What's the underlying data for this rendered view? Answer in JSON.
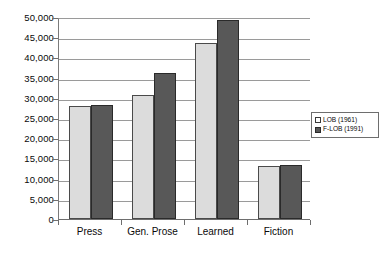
{
  "chart_data": {
    "type": "bar",
    "title": "",
    "subtitle": "",
    "xlabel": "",
    "ylabel": "",
    "categories": [
      "Press",
      "Gen. Prose",
      "Learned",
      "Fiction"
    ],
    "series": [
      {
        "name": "LOB (1961)",
        "values": [
          28000,
          30700,
          43600,
          13000
        ],
        "color": "#dcdcdc"
      },
      {
        "name": "F-LOB (1991)",
        "values": [
          28300,
          36200,
          49300,
          13300
        ],
        "color": "#585858"
      }
    ],
    "ylim": [
      0,
      50000
    ],
    "ytick_values": [
      0,
      5000,
      10000,
      15000,
      20000,
      25000,
      30000,
      35000,
      40000,
      45000,
      50000
    ],
    "ytick_labels": [
      "0",
      "5,000",
      "10,000",
      "15,000",
      "20,000",
      "25,000",
      "30,000",
      "35,000",
      "40,000",
      "45,000",
      "50,000"
    ],
    "grid": true,
    "grid_axis": "y",
    "legend_position": "right",
    "legend_entries": [
      "LOB (1961)",
      "F-LOB (1991)"
    ]
  }
}
